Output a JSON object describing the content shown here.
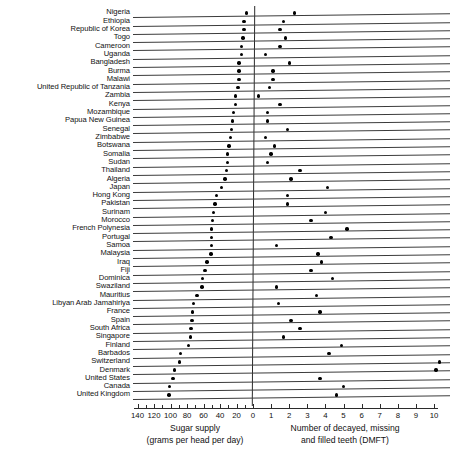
{
  "chart_data": {
    "type": "scatter",
    "orientation": "horizontal-paired-dot",
    "title": "",
    "categories": [
      "Nigeria",
      "Ethiopia",
      "Republic of Korea",
      "Togo",
      "Cameroon",
      "Uganda",
      "Bangladesh",
      "Burma",
      "Malawi",
      "United Republic of Tanzania",
      "Zambia",
      "Kenya",
      "Mozambique",
      "Papua New Guinea",
      "Senegal",
      "Zimbabwe",
      "Botswana",
      "Somalia",
      "Sudan",
      "Thailand",
      "Algeria",
      "Japan",
      "Hong Kong",
      "Pakistan",
      "Surinam",
      "Morocco",
      "French Polynesia",
      "Portugal",
      "Samoa",
      "Malaysia",
      "Iraq",
      "Fiji",
      "Dominica",
      "Swaziland",
      "Mauritius",
      "Libyan Arab Jamahiriya",
      "France",
      "Spain",
      "South Africa",
      "Singapore",
      "Finland",
      "Barbados",
      "Switzerland",
      "Denmark",
      "United States",
      "Canada",
      "United Kingdom"
    ],
    "series": [
      {
        "name": "Sugar supply",
        "axis": "left",
        "units": "grams per head per day",
        "label": "Sugar supply (grams per head per day)",
        "axis_direction": "reversed",
        "axis_range": [
          140,
          0
        ],
        "ticks": [
          140,
          120,
          100,
          80,
          60,
          40,
          20,
          0
        ],
        "minor_ticks_per_interval": 1,
        "values": [
          8,
          11,
          11,
          12,
          14,
          14,
          17,
          17,
          17,
          18,
          21,
          21,
          24,
          25,
          26,
          27,
          29,
          31,
          31,
          32,
          34,
          38,
          44,
          46,
          48,
          49,
          50,
          50,
          50,
          51,
          56,
          58,
          61,
          62,
          68,
          72,
          73,
          74,
          75,
          76,
          78,
          88,
          89,
          95,
          97,
          101,
          102
        ]
      },
      {
        "name": "Number of decayed, missing and filled teeth (DMFT)",
        "axis": "right",
        "units": "DMFT",
        "label": "Number of decayed, missing and filled teeth (DMFT)",
        "axis_direction": "normal",
        "axis_range": [
          0,
          10
        ],
        "ticks": [
          0,
          1,
          2,
          3,
          4,
          5,
          6,
          7,
          8,
          9,
          10
        ],
        "minor_ticks_per_interval": 0,
        "values": [
          2.3,
          1.7,
          1.5,
          1.8,
          1.5,
          0.7,
          2.0,
          1.1,
          1.1,
          0.9,
          0.3,
          1.5,
          0.8,
          0.8,
          1.9,
          0.7,
          1.2,
          1.0,
          0.8,
          2.6,
          2.1,
          4.1,
          1.9,
          1.9,
          4.0,
          3.2,
          5.2,
          4.3,
          1.3,
          3.6,
          3.8,
          3.2,
          4.4,
          1.3,
          3.5,
          1.4,
          3.7,
          2.1,
          2.6,
          1.7,
          4.9,
          4.2,
          10.3,
          10.1,
          3.7,
          5.0,
          4.6
        ]
      }
    ],
    "left_axis_label_lines": [
      "Sugar supply",
      "(grams per head per day)"
    ],
    "right_axis_label_lines": [
      "Number of decayed, missing",
      "and filled teeth (DMFT)"
    ],
    "grid": "per-row-baseline",
    "legend": "none",
    "zero_divider": true
  },
  "colors": {
    "dot": "#000000",
    "axis": "#2b2b2b",
    "rule": "#3b3b3b",
    "text": "#111111",
    "background": "#ffffff"
  }
}
